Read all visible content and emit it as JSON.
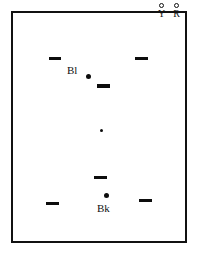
{
  "figure": {
    "title": "",
    "frame": {
      "border_color": "#111111",
      "background": "#ffffff"
    },
    "marker_color": "#0d0d0d"
  },
  "legend": {
    "entries": [
      {
        "symbol": "open-circle",
        "label": "Y",
        "x": 4,
        "y": 0
      },
      {
        "symbol": "open-circle",
        "label": "R",
        "x": 18,
        "y": 0
      }
    ]
  },
  "chart_data": {
    "type": "scatter",
    "title": "",
    "xlabel": "",
    "ylabel": "",
    "xlim": [
      0,
      172
    ],
    "ylim": [
      0,
      228
    ],
    "grid": false,
    "legend_position": "top-right",
    "series": [
      {
        "name": "dash-markers",
        "marker": "horizontal-dash",
        "color": "#0d0d0d",
        "points": [
          {
            "x": 36,
            "y": 44,
            "w": 12,
            "h": 3
          },
          {
            "x": 122,
            "y": 44,
            "w": 13,
            "h": 3
          },
          {
            "x": 84,
            "y": 71,
            "w": 13,
            "h": 4
          },
          {
            "x": 81,
            "y": 163,
            "w": 13,
            "h": 3
          },
          {
            "x": 33,
            "y": 189,
            "w": 13,
            "h": 3
          },
          {
            "x": 126,
            "y": 186,
            "w": 13,
            "h": 3
          }
        ]
      },
      {
        "name": "point-markers",
        "marker": "filled-circle",
        "color": "#0d0d0d",
        "points": [
          {
            "x": 73,
            "y": 61,
            "size": 5,
            "label": "Bl"
          },
          {
            "x": 87,
            "y": 116,
            "size": 3,
            "label": ""
          },
          {
            "x": 91,
            "y": 180,
            "size": 5,
            "label": "Bk"
          }
        ]
      }
    ],
    "annotations": [
      {
        "text": "Bl",
        "x": 54,
        "y": 52
      },
      {
        "text": "Bk",
        "x": 84,
        "y": 190
      }
    ]
  }
}
